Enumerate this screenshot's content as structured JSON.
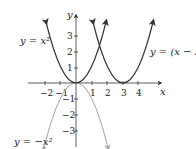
{
  "figure": {
    "axes": {
      "x_label": "x",
      "y_label": "y",
      "x_ticks": [
        "−2",
        "−1",
        "1",
        "2",
        "3",
        "4"
      ],
      "y_ticks": [
        "3",
        "2",
        "1",
        "−1",
        "−2",
        "−3"
      ]
    },
    "curves": [
      {
        "label": "y = x²",
        "color": "#333333"
      },
      {
        "label": "y = (x − 3)²",
        "color": "#333333"
      },
      {
        "label": "y = −x²",
        "color": "#b0b0b0"
      }
    ]
  }
}
